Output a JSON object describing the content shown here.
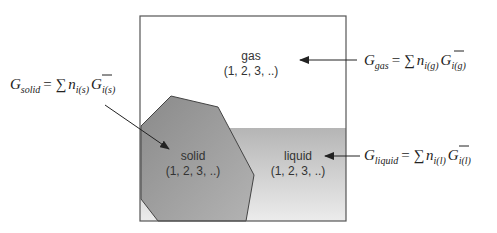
{
  "diagram": {
    "type": "phase-system",
    "colors": {
      "border": "#555555",
      "gas": "#ffffff",
      "liquid_top": "#b8b8b8",
      "liquid_bottom": "#ececec",
      "solid_top": "#8c8c8c",
      "solid_bottom": "#b0b0b0",
      "arrow": "#222222"
    },
    "phases": [
      {
        "id": "gas",
        "name": "gas",
        "components": "(1, 2, 3, ..)"
      },
      {
        "id": "solid",
        "name": "solid",
        "components": "(1, 2, 3, ..)"
      },
      {
        "id": "liquid",
        "name": "liquid",
        "components": "(1, 2, 3, ..)"
      }
    ],
    "equations": {
      "gas": {
        "lhs": "G",
        "lhs_sub": "gas",
        "sum": "= ∑",
        "n": "n",
        "n_sub": "i(g)",
        "g": "G",
        "g_sub": "i(g)"
      },
      "solid": {
        "lhs": "G",
        "lhs_sub": "solid",
        "sum": "= ∑",
        "n": "n",
        "n_sub": "i(s)",
        "g": "G",
        "g_sub": "i(s)"
      },
      "liquid": {
        "lhs": "G",
        "lhs_sub": "liquid",
        "sum": "= ∑",
        "n": "n",
        "n_sub": "i(l)",
        "g": "G",
        "g_sub": "i(l)"
      }
    }
  }
}
